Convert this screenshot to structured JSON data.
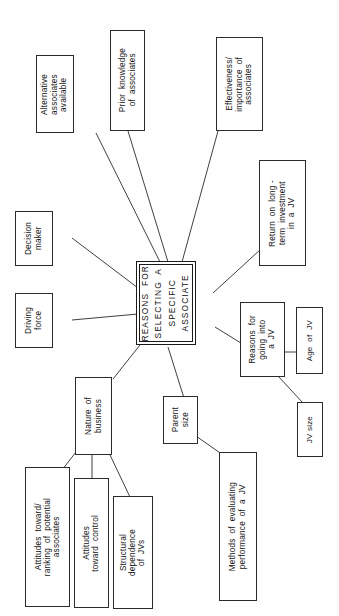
{
  "diagram": {
    "title": "REASONS FOR SELECTING A SPECIFIC ASSOCIATE",
    "orientation": "rotated-90-ccw",
    "ink_color": "#2b2b2b",
    "background_color": "#ffffff",
    "nodes": {
      "central": "REASONS  FOR\nSELECTING  A\nSPECIFIC\nASSOCIATE",
      "alternative_associates": "Alternative\nassociates\navailable",
      "prior_knowledge": "Prior  knowledge\nof  associates",
      "effectiveness_importance": "Effectiveness/\nimportance  of\nassociates",
      "return_on_investment": "Return  on  long -\nterm  investment\nin  a  JV",
      "decision_maker": "Decision\nmaker",
      "driving_force": "Driving\nforce",
      "reasons_going_into_jv": "Reasons  for\ngoing  into\na  JV",
      "age_of_jv": "Age  of  JV",
      "jv_size": "JV size",
      "nature_of_business": "Nature  of\nbusiness",
      "parent_size": "Parent\nsize",
      "methods_evaluating": "Methods  of  evaluating\nperformance  of  a  JV",
      "attitudes_ranking": "Attitudes  toward/\nranking  of  potential\nassociates",
      "attitudes_control": "Attitudes\ntoward  control",
      "structural_dependence": "Structural\ndependence\nof  JVs"
    }
  }
}
